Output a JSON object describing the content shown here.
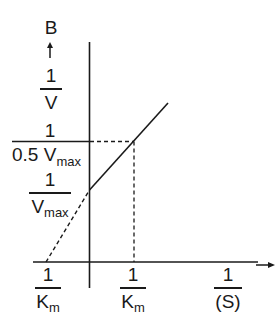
{
  "diagram": {
    "type": "lineweaver-burk-plot",
    "panel_label": "B",
    "y_axis": {
      "label_numerator": "1",
      "label_denominator": "V",
      "arrow": "up-arrow"
    },
    "x_axis": {
      "label_numerator": "1",
      "label_denominator": "(S)",
      "arrow": "right-arrow"
    },
    "y_ticks": [
      {
        "numerator": "1",
        "denominator_main": "0.5 V",
        "denominator_sub": "max"
      },
      {
        "numerator": "1",
        "denominator_main": "V",
        "denominator_sub": "max"
      }
    ],
    "x_ticks": [
      {
        "numerator": "1",
        "denominator_main": "K",
        "denominator_sub": "m",
        "position": "left-intercept"
      },
      {
        "numerator": "1",
        "denominator_main": "K",
        "denominator_sub": "m",
        "position": "right"
      }
    ],
    "colors": {
      "ink": "#1a1a1a",
      "background": "#ffffff"
    }
  }
}
